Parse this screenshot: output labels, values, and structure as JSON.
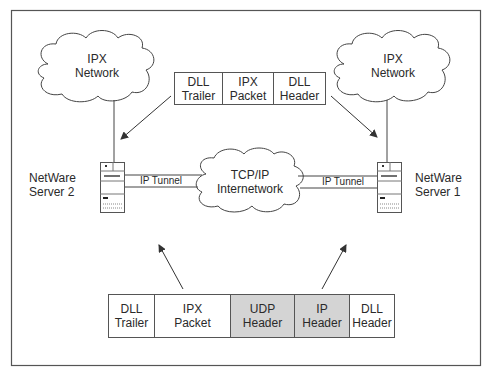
{
  "diagram": {
    "clouds": {
      "left": {
        "line1": "IPX",
        "line2": "Network"
      },
      "right": {
        "line1": "IPX",
        "line2": "Network"
      },
      "center": {
        "line1": "TCP/IP",
        "line2": "Internetwork"
      }
    },
    "servers": {
      "left": {
        "line1": "NetWare",
        "line2": "Server 2"
      },
      "right": {
        "line1": "NetWare",
        "line2": "Server 1"
      }
    },
    "tunnels": {
      "left": "IP Tunnel",
      "right": "IP Tunnel"
    },
    "top_packet": {
      "cells": [
        {
          "line1": "DLL",
          "line2": "Trailer",
          "shaded": false
        },
        {
          "line1": "IPX",
          "line2": "Packet",
          "shaded": false
        },
        {
          "line1": "DLL",
          "line2": "Header",
          "shaded": false
        }
      ]
    },
    "bottom_packet": {
      "cells": [
        {
          "line1": "DLL",
          "line2": "Trailer",
          "shaded": false
        },
        {
          "line1": "IPX",
          "line2": "Packet",
          "shaded": false
        },
        {
          "line1": "UDP",
          "line2": "Header",
          "shaded": true
        },
        {
          "line1": "IP",
          "line2": "Header",
          "shaded": true
        },
        {
          "line1": "DLL",
          "line2": "Header",
          "shaded": false
        }
      ]
    },
    "colors": {
      "line": "#444444",
      "shaded_cell": "#d4d4d4",
      "frame": "#555555"
    }
  }
}
